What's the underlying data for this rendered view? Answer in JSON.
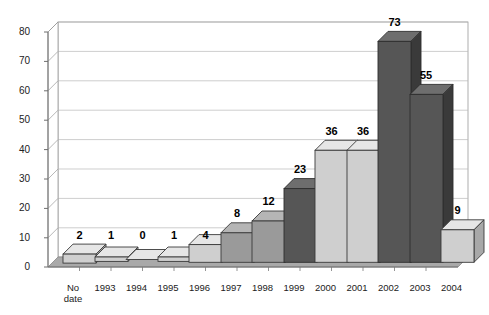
{
  "chart_data": {
    "type": "bar",
    "title": "INCREASE IN RESEARCH ON TRAFFICKING",
    "xlabel": "",
    "ylabel": "",
    "categories": [
      "No date",
      "1993",
      "1994",
      "1995",
      "1996",
      "1997",
      "1998",
      "1999",
      "2000",
      "2001",
      "2002",
      "2003",
      "2004"
    ],
    "values": [
      2,
      1,
      0,
      1,
      4,
      8,
      12,
      23,
      36,
      36,
      73,
      55,
      9
    ],
    "ylim": [
      0,
      80
    ],
    "yticks": [
      0,
      10,
      20,
      30,
      40,
      50,
      60,
      70,
      80
    ],
    "ytick_labels": [
      "0",
      "10",
      "20",
      "30",
      "40",
      "50",
      "60",
      "70",
      "80"
    ],
    "grid": true,
    "legend": "none",
    "style": "3d-column",
    "bar_shades": [
      "light",
      "light",
      "light",
      "light",
      "light",
      "medium",
      "medium",
      "dark",
      "light",
      "light",
      "dark",
      "dark",
      "light"
    ],
    "data_labels": [
      "2",
      "1",
      "0",
      "1",
      "4",
      "8",
      "12",
      "23",
      "36",
      "36",
      "73",
      "55",
      "9"
    ],
    "colors": {
      "light_face": "#cfcfcf",
      "light_side": "#a8a8a8",
      "light_top": "#e6e6e6",
      "medium_face": "#9a9a9a",
      "medium_side": "#767676",
      "medium_top": "#b5b5b5",
      "dark_face": "#565656",
      "dark_side": "#3a3a3a",
      "dark_top": "#6e6e6e",
      "floor": "#a9a9a9",
      "wall": "#ffffff",
      "grid": "#b4b4b4",
      "axis": "#6e6e6e",
      "text": "#1a1a1a"
    }
  }
}
